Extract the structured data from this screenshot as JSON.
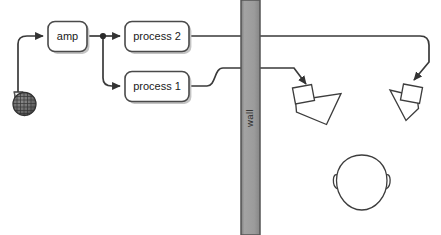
{
  "diagram": {
    "background_color": "#ffffff",
    "line_color": "#3a3a3a",
    "box_fill": "#ffffff",
    "box_stroke": "#4a4a4a",
    "shadow_color": "#b8b8b8",
    "wall_fill": "#9c9c9c",
    "wall_stroke": "#555555",
    "nodes": [
      {
        "id": "amp",
        "label": "amp",
        "shape": "rounded-rect"
      },
      {
        "id": "process2",
        "label": "process 2",
        "shape": "rounded-rect"
      },
      {
        "id": "process1",
        "label": "process 1",
        "shape": "rounded-rect"
      }
    ],
    "wall": {
      "label": "wall",
      "orientation": "vertical",
      "label_rotation": "-90"
    },
    "source": {
      "id": "microphone",
      "icon": "microphone-icon",
      "label": ""
    },
    "listener": {
      "id": "head",
      "icon": "head-icon",
      "label": ""
    },
    "outputs": [
      {
        "id": "speaker-left",
        "icon": "horn-speaker-icon",
        "label": "",
        "fed_by": "process 1"
      },
      {
        "id": "speaker-right",
        "icon": "horn-speaker-icon",
        "label": "",
        "fed_by": "process 2"
      }
    ],
    "connections": [
      {
        "from": "microphone",
        "to": "amp"
      },
      {
        "from": "amp",
        "to": "process 2"
      },
      {
        "from": "amp",
        "to": "process 1"
      },
      {
        "from": "process 1",
        "to": "speaker-left"
      },
      {
        "from": "process 2",
        "to": "speaker-right"
      }
    ]
  }
}
